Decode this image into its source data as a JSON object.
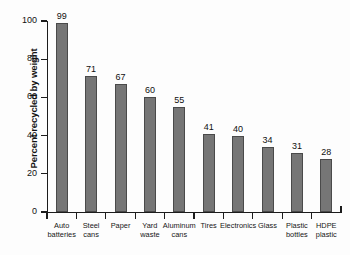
{
  "chart_data": {
    "type": "bar",
    "title": "",
    "xlabel": "",
    "ylabel": "Percent recycled by weight",
    "categories": [
      "Auto batteries",
      "Steel cans",
      "Paper",
      "Yard waste",
      "Aluminum cans",
      "Tires",
      "Electronics",
      "Glass",
      "Plastic bottles",
      "HDPE plastic"
    ],
    "category_lines": [
      [
        "Auto",
        "batteries"
      ],
      [
        "Steel",
        "cans"
      ],
      [
        "Paper",
        ""
      ],
      [
        "Yard",
        "waste"
      ],
      [
        "Aluminum",
        "cans"
      ],
      [
        "Tires",
        ""
      ],
      [
        "Electronics",
        ""
      ],
      [
        "Glass",
        ""
      ],
      [
        "Plastic",
        "bottles"
      ],
      [
        "HDPE",
        "plastic"
      ]
    ],
    "values": [
      99,
      71,
      67,
      60,
      55,
      41,
      40,
      34,
      31,
      28
    ],
    "value_labels": [
      "99",
      "71",
      "67",
      "60",
      "55",
      "41",
      "40",
      "34",
      "31",
      "28"
    ],
    "ylim": [
      0,
      100
    ],
    "ytick_values": [
      0,
      20,
      40,
      60,
      80,
      100
    ],
    "ytick_labels": [
      "0",
      "20",
      "40",
      "60",
      "80",
      "100"
    ],
    "grid": false,
    "legend": false,
    "bar_color": "#767676",
    "bar_edge_color": "#4a4a4a",
    "axis_color": "#1c1c1c",
    "background_color": "#fdfdfd"
  }
}
